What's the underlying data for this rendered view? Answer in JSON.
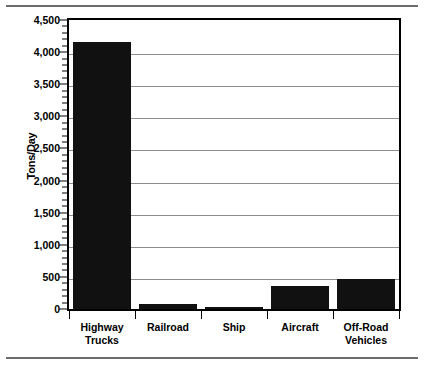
{
  "figure": {
    "ylabel": "Tons/Day",
    "rule_top": "horizontal-rule",
    "rule_bottom": "horizontal-rule"
  },
  "chart_data": {
    "type": "bar",
    "title": "",
    "subtitle": "",
    "xlabel": "",
    "ylabel": "Tons/Day",
    "categories": [
      "Highway\nTrucks",
      "Railroad",
      "Ship",
      "Aircraft",
      "Off-Road\nVehicles"
    ],
    "values": [
      4150,
      75,
      25,
      365,
      470
    ],
    "ylim": [
      0,
      4500
    ],
    "ytick_values": [
      0,
      500,
      1000,
      1500,
      2000,
      2500,
      3000,
      3500,
      4000,
      4500
    ],
    "ytick_labels": [
      "0",
      "500",
      "1,000",
      "1,500",
      "2,000",
      "2,500",
      "3,000",
      "3,500",
      "4,000",
      "4,500"
    ],
    "minor_tick_interval": 100,
    "grid": true,
    "grid_axis": "y",
    "legend": false,
    "legend_position": "none",
    "bar_color": "#111111",
    "gridline_color": "#8d8d8d",
    "axis_color": "#000000",
    "background_color": "#ffffff"
  }
}
